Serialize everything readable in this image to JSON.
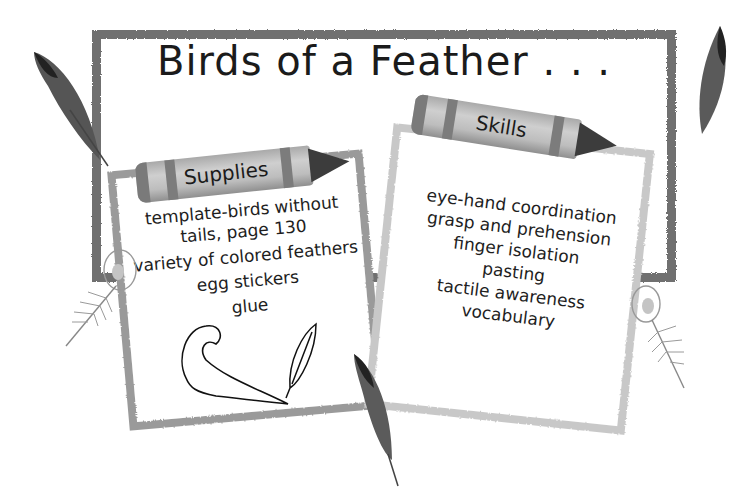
{
  "title": "Birds of a Feather . . .",
  "supplies": {
    "heading": "Supplies",
    "items": [
      "template-birds without tails, page 130",
      "variety of colored feathers",
      "egg stickers",
      "glue"
    ]
  },
  "skills": {
    "heading": "Skills",
    "items": [
      "eye-hand coordination",
      "grasp and prehension",
      "finger isolation",
      "pasting",
      "tactile awareness",
      "vocabulary"
    ]
  },
  "decorations": {
    "icons": [
      "dark-feather-icon",
      "peacock-feather-icon",
      "curled-feather-outline-icon",
      "leaf-feather-outline-icon",
      "crayon-icon"
    ]
  }
}
